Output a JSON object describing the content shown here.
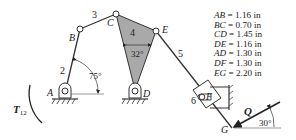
{
  "diagram": {
    "joints": {
      "A": "A",
      "B": "B",
      "C": "C",
      "D": "D",
      "E": "E",
      "F": "F",
      "G": "G"
    },
    "links": {
      "l2": "2",
      "l3": "3",
      "l4": "4",
      "l5": "5",
      "l6": "6"
    },
    "angles": {
      "crank": "75°",
      "ternary": "32°",
      "force": "30°"
    },
    "loads": {
      "torque": "T",
      "torque_sub": "12",
      "force": "Q"
    },
    "colors": {
      "link": "#333333",
      "ternary_fill": "#a9a9a9",
      "ground": "#333333"
    }
  },
  "dimensions": [
    {
      "name": "AB",
      "value": "= 1.16 in"
    },
    {
      "name": "BC",
      "value": "= 0.70 in"
    },
    {
      "name": "CD",
      "value": "= 1.45 in"
    },
    {
      "name": "DE",
      "value": "= 1.16 in"
    },
    {
      "name": "AD",
      "value": "= 1.30 in"
    },
    {
      "name": "DF",
      "value": " = 1.30 in"
    },
    {
      "name": "EG",
      "value": " = 2.20 in"
    }
  ]
}
